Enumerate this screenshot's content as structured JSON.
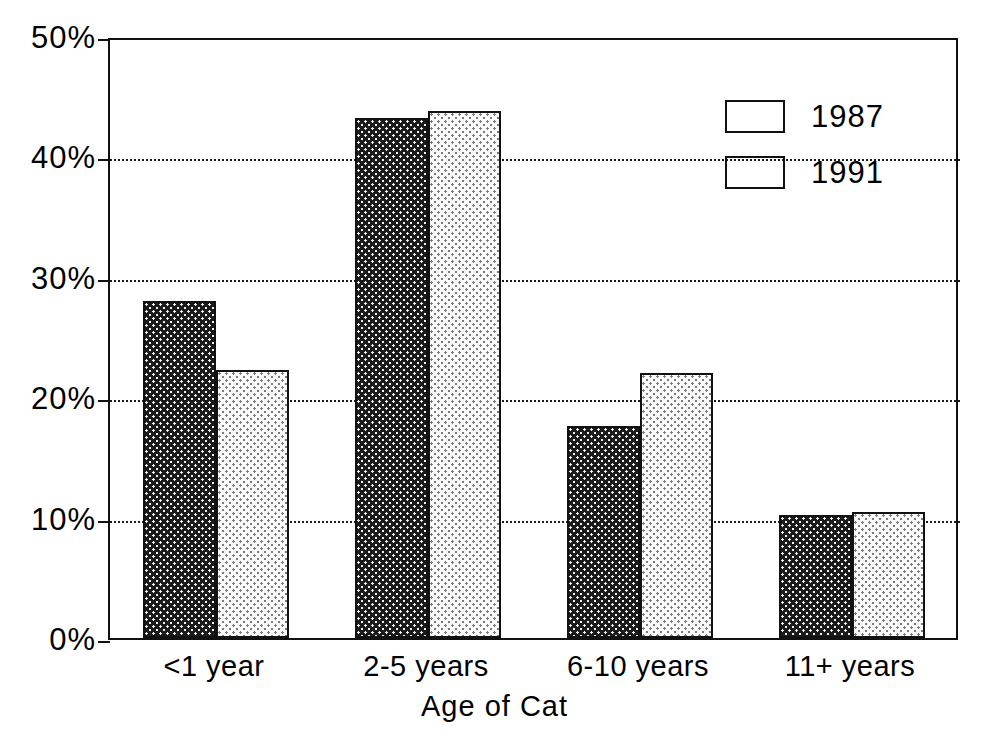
{
  "chart_data": {
    "type": "bar",
    "title": "",
    "xlabel": "Age of Cat",
    "ylabel": "",
    "categories": [
      "<1 year",
      "2-5 years",
      "6-10 years",
      "11+ years"
    ],
    "series": [
      {
        "name": "1987",
        "values": [
          28.0,
          43.2,
          17.6,
          10.2
        ],
        "color": "#1b1b1b"
      },
      {
        "name": "1991",
        "values": [
          22.3,
          43.8,
          22.0,
          10.5
        ],
        "color": "#fbfbfb"
      }
    ],
    "ylim": [
      0,
      50
    ],
    "yticks": [
      0,
      10,
      20,
      30,
      40,
      50
    ],
    "ytick_labels": [
      "0%",
      "10%",
      "20%",
      "30%",
      "40%",
      "50%"
    ],
    "grid": true,
    "grid_axis": "y",
    "legend_position": "top-right"
  },
  "axes": {
    "y": {
      "ticks": [
        {
          "label": "50%",
          "value": 50
        },
        {
          "label": "40%",
          "value": 40
        },
        {
          "label": "30%",
          "value": 30
        },
        {
          "label": "20%",
          "value": 20
        },
        {
          "label": "10%",
          "value": 10
        },
        {
          "label": "0%",
          "value": 0
        }
      ]
    },
    "x": {
      "title": "Age of Cat",
      "ticks": [
        {
          "label": "<1 year"
        },
        {
          "label": "2-5 years"
        },
        {
          "label": "6-10 years"
        },
        {
          "label": "11+ years"
        }
      ]
    }
  },
  "legend": {
    "entries": [
      {
        "label": "1987",
        "pattern": "dark-dotted"
      },
      {
        "label": "1991",
        "pattern": "light-dotted"
      }
    ]
  }
}
